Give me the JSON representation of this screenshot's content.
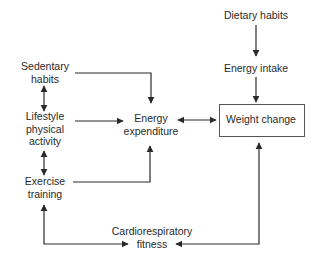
{
  "diagram": {
    "nodes": {
      "dietary_habits": {
        "label": "Dietary habits"
      },
      "energy_intake": {
        "label": "Energy intake"
      },
      "sedentary_habits": {
        "line1": "Sedentary",
        "line2": "habits"
      },
      "lifestyle_activity": {
        "line1": "Lifestyle",
        "line2": "physical",
        "line3": "activity"
      },
      "exercise_training": {
        "line1": "Exercise",
        "line2": "training"
      },
      "energy_expenditure": {
        "line1": "Energy",
        "line2": "expenditure"
      },
      "weight_change": {
        "label": "Weight change"
      },
      "cardio_fitness": {
        "line1": "Cardiorespiratory",
        "line2": "fitness"
      }
    },
    "edges": [
      {
        "from": "Dietary habits",
        "to": "Energy intake",
        "type": "one-way"
      },
      {
        "from": "Energy intake",
        "to": "Weight change",
        "type": "one-way"
      },
      {
        "from": "Sedentary habits",
        "to": "Energy expenditure",
        "type": "one-way"
      },
      {
        "from": "Lifestyle physical activity",
        "to": "Energy expenditure",
        "type": "one-way"
      },
      {
        "from": "Exercise training",
        "to": "Energy expenditure",
        "type": "one-way"
      },
      {
        "from": "Energy expenditure",
        "to": "Weight change",
        "type": "two-way"
      },
      {
        "from": "Sedentary habits",
        "to": "Lifestyle physical activity",
        "type": "two-way"
      },
      {
        "from": "Lifestyle physical activity",
        "to": "Exercise training",
        "type": "two-way"
      },
      {
        "from": "Exercise training",
        "to": "Cardiorespiratory fitness",
        "type": "two-way"
      },
      {
        "from": "Weight change",
        "to": "Cardiorespiratory fitness",
        "type": "two-way"
      }
    ],
    "colors": {
      "line": "#2a2a2a",
      "text": "#2a2a2a",
      "box_border": "#555555"
    }
  }
}
